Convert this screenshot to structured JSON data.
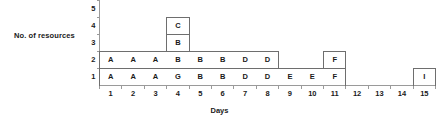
{
  "chart_data": {
    "type": "bar",
    "title": "",
    "xlabel": "Days",
    "ylabel": "No. of resources",
    "x": [
      1,
      2,
      3,
      4,
      5,
      6,
      7,
      8,
      9,
      10,
      11,
      12,
      13,
      14,
      15
    ],
    "xticklabels": [
      "1",
      "2",
      "3",
      "4",
      "5",
      "6",
      "7",
      "8",
      "9",
      "10",
      "11",
      "12",
      "13",
      "14",
      "15"
    ],
    "yticklabels": [
      "5",
      "4",
      "3",
      "2",
      "1"
    ],
    "ylim": [
      0,
      5
    ],
    "xlim": [
      0.5,
      15.5
    ],
    "grid": false,
    "legend": null,
    "categories": [
      "1",
      "2",
      "3",
      "4",
      "5",
      "6",
      "7",
      "8",
      "9",
      "10",
      "11",
      "12",
      "13",
      "14",
      "15"
    ],
    "values": [
      2,
      2,
      2,
      4,
      2,
      2,
      2,
      2,
      1,
      1,
      2,
      0,
      0,
      0,
      1
    ],
    "cells": [
      {
        "day": 1,
        "level": 1,
        "label": "A"
      },
      {
        "day": 1,
        "level": 2,
        "label": "A"
      },
      {
        "day": 2,
        "level": 1,
        "label": "A"
      },
      {
        "day": 2,
        "level": 2,
        "label": "A"
      },
      {
        "day": 3,
        "level": 1,
        "label": "A"
      },
      {
        "day": 3,
        "level": 2,
        "label": "A"
      },
      {
        "day": 4,
        "level": 1,
        "label": "G"
      },
      {
        "day": 4,
        "level": 2,
        "label": "B"
      },
      {
        "day": 4,
        "level": 3,
        "label": "B"
      },
      {
        "day": 4,
        "level": 4,
        "label": "C"
      },
      {
        "day": 5,
        "level": 1,
        "label": "B"
      },
      {
        "day": 5,
        "level": 2,
        "label": "B"
      },
      {
        "day": 6,
        "level": 1,
        "label": "B"
      },
      {
        "day": 6,
        "level": 2,
        "label": "B"
      },
      {
        "day": 7,
        "level": 1,
        "label": "D"
      },
      {
        "day": 7,
        "level": 2,
        "label": "D"
      },
      {
        "day": 8,
        "level": 1,
        "label": "D"
      },
      {
        "day": 8,
        "level": 2,
        "label": "D"
      },
      {
        "day": 9,
        "level": 1,
        "label": "E"
      },
      {
        "day": 10,
        "level": 1,
        "label": "E"
      },
      {
        "day": 11,
        "level": 1,
        "label": "F"
      },
      {
        "day": 11,
        "level": 2,
        "label": "F"
      },
      {
        "day": 15,
        "level": 1,
        "label": "I"
      }
    ],
    "colors": {
      "outline": "#6e6e6e",
      "axis": "#9a9a9a",
      "text": "#1a1a1a",
      "background": "#ffffff"
    }
  }
}
